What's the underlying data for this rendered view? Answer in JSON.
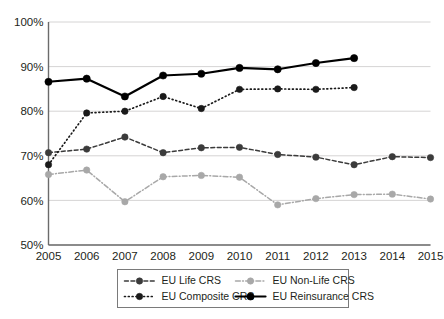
{
  "chart_data": {
    "type": "line",
    "title": "",
    "xlabel": "",
    "ylabel": "",
    "categories": [
      "2005",
      "2006",
      "2007",
      "2008",
      "2009",
      "2010",
      "2011",
      "2012",
      "2013",
      "2014",
      "2015"
    ],
    "x": [
      2005,
      2006,
      2007,
      2008,
      2009,
      2010,
      2011,
      2012,
      2013,
      2014,
      2015
    ],
    "ylim": [
      50,
      100
    ],
    "y_tick_labels": [
      "50%",
      "60%",
      "70%",
      "80%",
      "90%",
      "100%"
    ],
    "y_ticks": [
      50,
      60,
      70,
      80,
      90,
      100
    ],
    "grid": "horizontal",
    "legend_position": "bottom",
    "series": [
      {
        "name": "EU Life CRS",
        "color": "#3b3b3b",
        "style": "dashed",
        "marker": "circle",
        "x": [
          2005,
          2006,
          2007,
          2008,
          2009,
          2010,
          2011,
          2012,
          2013,
          2014,
          2015
        ],
        "values": [
          70.7,
          71.5,
          74.2,
          70.7,
          71.8,
          71.9,
          70.3,
          69.7,
          68.0,
          69.8,
          69.6
        ]
      },
      {
        "name": "EU Non-Life CRS",
        "color": "#a8a8a8",
        "style": "dash-dot",
        "marker": "circle",
        "x": [
          2005,
          2006,
          2007,
          2008,
          2009,
          2010,
          2011,
          2012,
          2013,
          2014,
          2015
        ],
        "values": [
          65.8,
          66.8,
          59.7,
          65.3,
          65.6,
          65.2,
          59.0,
          60.4,
          61.3,
          61.4,
          60.3
        ]
      },
      {
        "name": "EU Composite CRS",
        "color": "#1a1a1a",
        "style": "dotted",
        "marker": "circle",
        "x": [
          2005,
          2006,
          2007,
          2008,
          2009,
          2010,
          2011,
          2012,
          2013
        ],
        "values": [
          68.0,
          79.6,
          80.0,
          83.3,
          80.6,
          84.9,
          85.0,
          84.9,
          85.3
        ]
      },
      {
        "name": "EU Reinsurance CRS",
        "color": "#000000",
        "style": "solid",
        "marker": "circle",
        "x": [
          2005,
          2006,
          2007,
          2008,
          2009,
          2010,
          2011,
          2012,
          2013
        ],
        "values": [
          86.6,
          87.3,
          83.3,
          88.0,
          88.4,
          89.7,
          89.4,
          90.8,
          91.9
        ]
      }
    ]
  },
  "legend": {
    "entries": [
      {
        "label": "EU Life CRS",
        "series_index": 0
      },
      {
        "label": "EU Non-Life CRS",
        "series_index": 1
      },
      {
        "label": "EU Composite CRS",
        "series_index": 2
      },
      {
        "label": "EU Reinsurance CRS",
        "series_index": 3
      }
    ]
  },
  "colors": {
    "grid": "#d0cfcf",
    "axis": "#6b6b6b",
    "text": "#231f20",
    "background": "#ffffff"
  }
}
